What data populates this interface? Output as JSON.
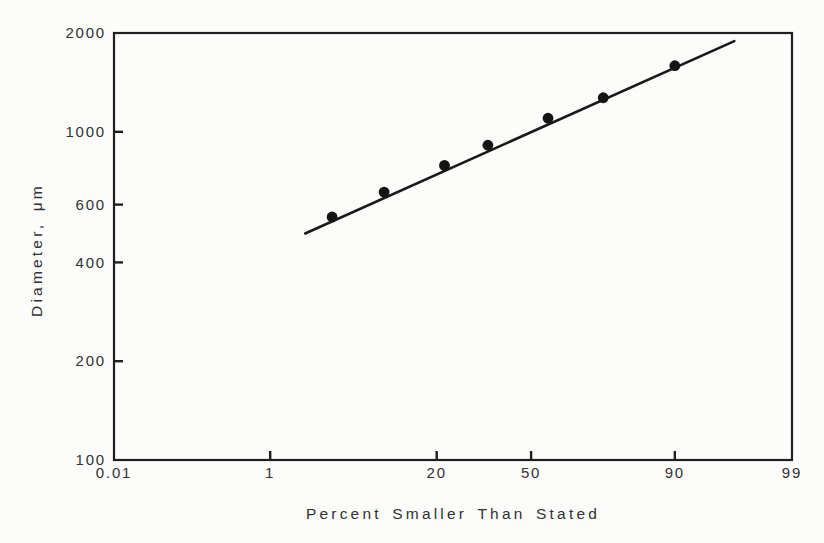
{
  "figure": {
    "background_color": "#fcfcfb"
  },
  "chart_data": {
    "type": "scatter",
    "title": "",
    "x_axis": {
      "label": "Percent Smaller Than Stated",
      "scale": "probit",
      "range": [
        0.01,
        99
      ],
      "tick_values": [
        0.01,
        1,
        20,
        50,
        90,
        99
      ],
      "tick_labels": [
        "0.01",
        "1",
        "20",
        "50",
        "90",
        "99"
      ],
      "inner_tick_values": [
        1,
        20,
        50,
        90
      ]
    },
    "y_axis": {
      "label": "Diameter, μm",
      "scale": "log",
      "range": [
        100,
        2000
      ],
      "tick_values": [
        100,
        200,
        400,
        600,
        1000,
        2000
      ],
      "tick_labels": [
        "100",
        "200",
        "400",
        "600",
        "1000",
        "2000"
      ],
      "inner_tick_values": [
        200,
        400,
        600,
        1000
      ]
    },
    "points": [
      {
        "percent": 3.8,
        "diameter": 550
      },
      {
        "percent": 9.5,
        "diameter": 655
      },
      {
        "percent": 22,
        "diameter": 790
      },
      {
        "percent": 35,
        "diameter": 910
      },
      {
        "percent": 56,
        "diameter": 1100
      },
      {
        "percent": 74,
        "diameter": 1270
      },
      {
        "percent": 90,
        "diameter": 1590
      }
    ],
    "fit_line": {
      "start": {
        "percent": 2.2,
        "diameter": 490
      },
      "end": {
        "percent": 96.5,
        "diameter": 1890
      }
    },
    "marker": {
      "shape": "filled-circle",
      "color": "#141414",
      "radius_px": 5.4
    },
    "line_color": "#1a1a1a",
    "axis_color": "#1f1f1f",
    "text_color": "#313131",
    "grid": "off",
    "legend": "none"
  }
}
